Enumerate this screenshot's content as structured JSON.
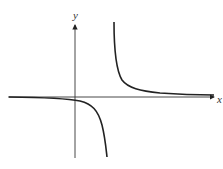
{
  "diagram": {
    "type": "function-graph",
    "axes": {
      "x_label": "x",
      "y_label": "y"
    },
    "colors": {
      "curve": "#222222",
      "axis": "#333333"
    }
  }
}
